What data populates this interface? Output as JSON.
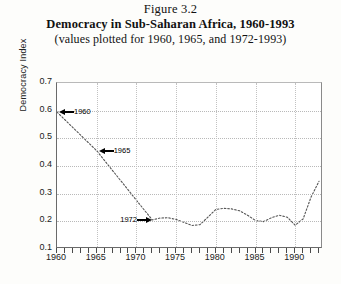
{
  "figure": {
    "number": "Figure 3.2",
    "title": "Democracy in Sub-Saharan Africa, 1960-1993",
    "subtitle": "(values plotted for 1960, 1965, and 1972-1993)"
  },
  "chart_data": {
    "type": "line",
    "title": "Democracy in Sub-Saharan Africa, 1960-1993",
    "subtitle": "(values plotted for 1960, 1965, and 1972-1993)",
    "xlabel": "",
    "ylabel": "Democracy Index",
    "xlim": [
      1960,
      1993.5
    ],
    "ylim": [
      0.1,
      0.7
    ],
    "grid": true,
    "legend": false,
    "line_style": "dotted",
    "line_color": "#555555",
    "x_major_ticks": [
      1960,
      1965,
      1970,
      1975,
      1980,
      1985,
      1990
    ],
    "x_minor_tick_step": 1,
    "y_ticks": [
      0.1,
      0.2,
      0.3,
      0.4,
      0.5,
      0.6,
      0.7
    ],
    "y_tick_labels": [
      "0.1",
      "0.2",
      "0.3",
      "0.4",
      "0.5",
      "0.6",
      "0.7"
    ],
    "x": [
      1960,
      1965,
      1972,
      1973,
      1974,
      1975,
      1976,
      1977,
      1978,
      1979,
      1980,
      1981,
      1982,
      1983,
      1984,
      1985,
      1986,
      1987,
      1988,
      1989,
      1990,
      1991,
      1992,
      1993
    ],
    "values": [
      0.595,
      0.455,
      0.205,
      0.212,
      0.213,
      0.207,
      0.196,
      0.185,
      0.188,
      0.215,
      0.243,
      0.247,
      0.245,
      0.238,
      0.222,
      0.203,
      0.199,
      0.213,
      0.222,
      0.215,
      0.186,
      0.209,
      0.288,
      0.345
    ],
    "annotations": [
      {
        "label": "1960",
        "x": 1960,
        "y": 0.595,
        "arrow": "left"
      },
      {
        "label": "1965",
        "x": 1965,
        "y": 0.455,
        "arrow": "left"
      },
      {
        "label": "1972",
        "x": 1972,
        "y": 0.205,
        "arrow": "right"
      }
    ]
  }
}
